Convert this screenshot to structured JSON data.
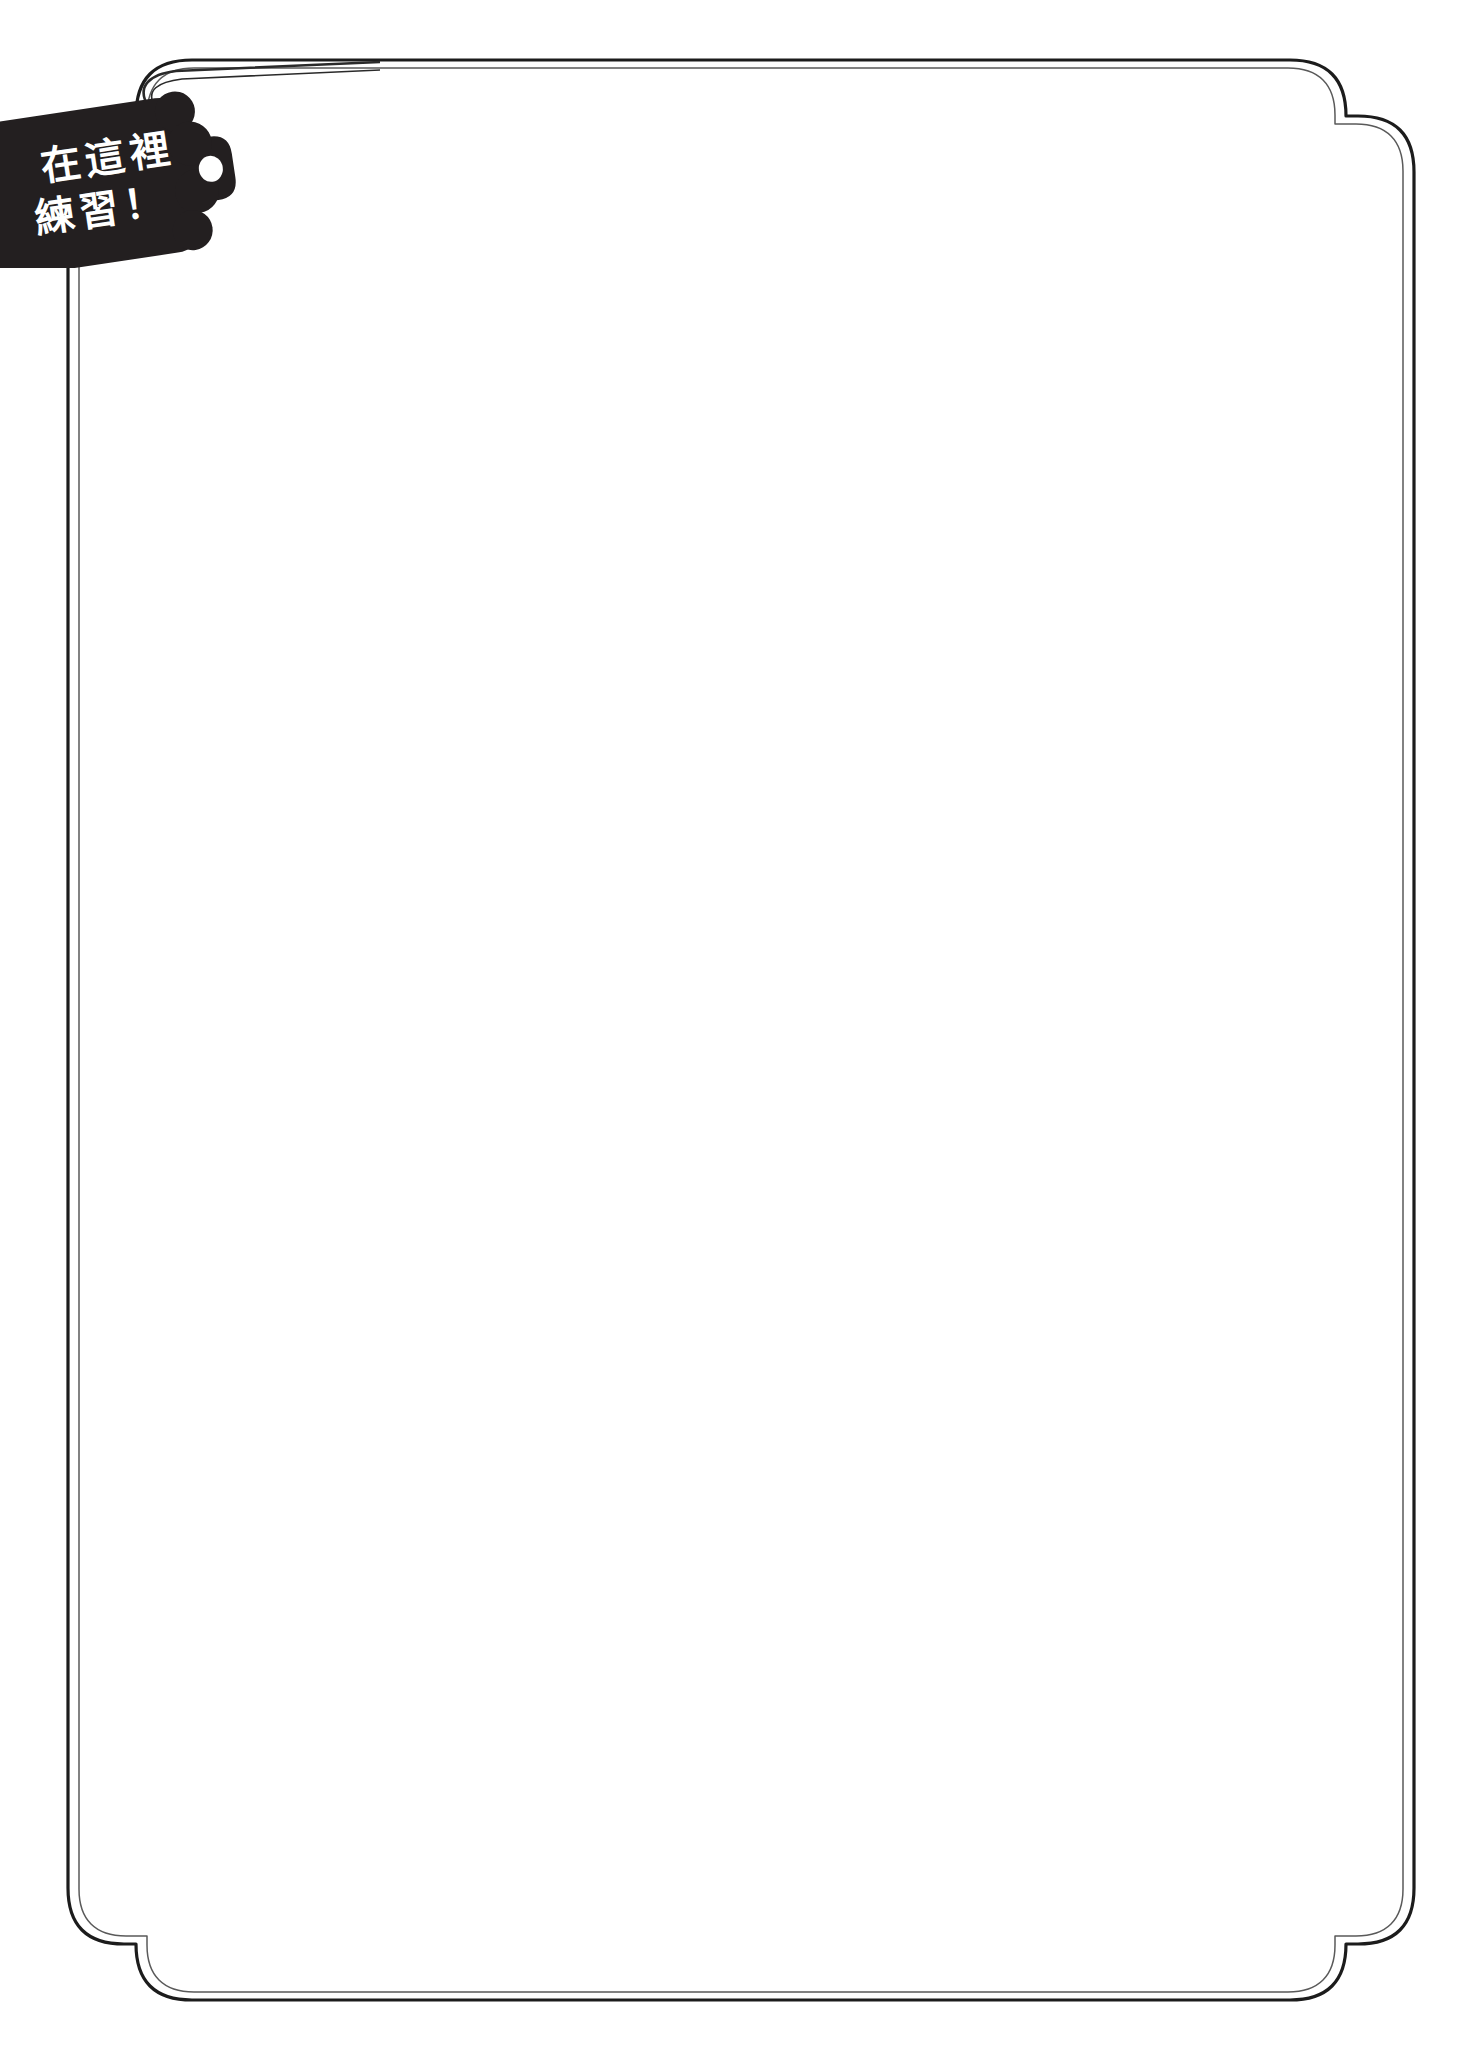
{
  "page": {
    "kind": "practice-worksheet-page",
    "background_color": "#ffffff",
    "width": 1470,
    "height": 2059,
    "content": ""
  },
  "border": {
    "name": "decorative-stepped-frame",
    "stroke_color": "#1c1c1c",
    "inner_stroke_color": "#4a4a4a",
    "style": "double-line rounded rectangle with stepped notch corners",
    "outer_stroke_width": 3,
    "inner_stroke_width": 1.4
  },
  "tag": {
    "name": "practice-here-tag",
    "background_color": "#231f20",
    "text_color": "#ffffff",
    "rotation_degrees": -8.5,
    "lines": [
      "在這裡",
      "練習！"
    ],
    "line_1": "在這裡",
    "line_2": "練習！",
    "full_text": "在這裡練習！",
    "translation_hint": "Practice here!",
    "hole": {
      "name": "tag-hole",
      "fill": "#ffffff"
    },
    "string": {
      "name": "tag-string",
      "stroke_color": "#1c1c1c"
    }
  },
  "writing_area": {
    "name": "blank-practice-area",
    "content": "",
    "placeholder": ""
  }
}
